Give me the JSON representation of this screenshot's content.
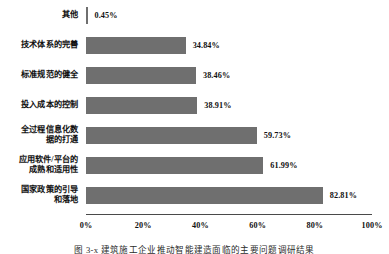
{
  "chart_data": {
    "type": "bar",
    "orientation": "horizontal",
    "title": "",
    "xlabel": "",
    "ylabel": "",
    "xlim": [
      0,
      100
    ],
    "grid": false,
    "legend": null,
    "categories": [
      "其他",
      "技术体系的完善",
      "标准规范的健全",
      "投入成本的控制",
      "全过程信息化数\n据的打通",
      "应用软件/平台的\n成熟和适用性",
      "国家政策的引导\n和落地"
    ],
    "values": [
      0.45,
      34.84,
      38.46,
      38.91,
      59.73,
      61.99,
      82.81
    ],
    "value_labels": [
      "0.45%",
      "34.84%",
      "38.46%",
      "38.91%",
      "59.73%",
      "61.99%",
      "82.81%"
    ],
    "x_ticks": [
      0,
      20,
      40,
      60,
      80,
      100
    ],
    "x_tick_labels": [
      "0%",
      "20%",
      "40%",
      "60%",
      "80%",
      "100%"
    ],
    "bar_color": "#6f6f6f",
    "axis_color": "#4a4a4a",
    "background": "#ffffff"
  },
  "caption": {
    "text": "图 3-x  建筑施工企业推动智能建造面临的主要问题调研结果"
  }
}
